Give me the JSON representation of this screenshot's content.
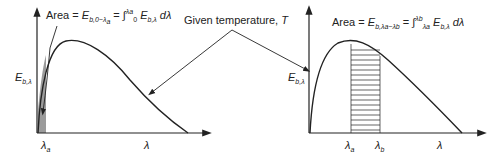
{
  "figure": {
    "left_plot": {
      "area_label_prefix": "Area = ",
      "area_symbol": "E",
      "area_subscript": "b,0−λ",
      "area_subscript_tail": "a",
      "area_eq": " = ∫",
      "int_upper": "λa",
      "int_lower": "0",
      "integrand": " E",
      "integrand_sub": "b,λ",
      "differential": " dλ",
      "y_label": "E",
      "y_label_sub": "b,λ",
      "x_tick": "λ",
      "x_tick_sub": "a",
      "x_label": "λ",
      "shading": "solid-gray"
    },
    "center_label": {
      "text": "Given temperature, ",
      "var": "T"
    },
    "right_plot": {
      "area_label_prefix": "Area = ",
      "area_symbol": "E",
      "area_subscript": "b,λa−λb",
      "area_eq": " = ∫",
      "int_upper": "λb",
      "int_lower": "λa",
      "integrand": " E",
      "integrand_sub": "b,λ",
      "differential": " dλ",
      "y_label": "E",
      "y_label_sub": "b,λ",
      "x_tick_a": "λ",
      "x_tick_a_sub": "a",
      "x_tick_b": "λ",
      "x_tick_b_sub": "b",
      "x_label": "λ",
      "shading": "horizontal-hatch"
    },
    "colors": {
      "line": "#222222",
      "shade": "#8a8a8a"
    }
  }
}
